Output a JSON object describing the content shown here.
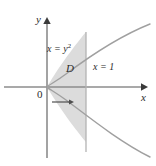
{
  "figure": {
    "background_color": "#ffffff",
    "width": 156,
    "height": 166
  },
  "axes": {
    "x_label": "x",
    "y_label": "y",
    "origin_label": "0",
    "axis_color": "#8c8c8c",
    "origin_px": {
      "x": 47,
      "y": 87
    },
    "x_axis_end_px": {
      "x": 146,
      "y": 87
    },
    "y_axis_top_px": {
      "x": 47,
      "y": 18
    }
  },
  "curves": [
    {
      "name": "parabola",
      "equation_text": "x = y",
      "equation_exponent": "2",
      "color": "#9a9a9a",
      "vertex_px": {
        "x": 47,
        "y": 87
      },
      "opens": "right"
    },
    {
      "name": "vertical-line",
      "equation_text": "x = 1",
      "color": "#b0b0b0",
      "x_px": 86,
      "y_top_px": 32,
      "y_bottom_px": 152
    }
  ],
  "region": {
    "label": "D",
    "fill_color": "#dcdcdc",
    "description": "Area between the parabola and the line x = 1"
  },
  "annotation_arrow": {
    "name": "horizontal-sweep-arrow",
    "color": "#555555",
    "from_px": {
      "x": 52,
      "y": 102
    },
    "to_px": {
      "x": 73,
      "y": 102
    }
  }
}
